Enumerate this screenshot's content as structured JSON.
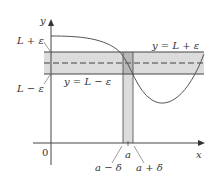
{
  "diagram": {
    "axes": {
      "x_label": "x",
      "y_label": "y",
      "origin_label": "0"
    },
    "y_labels": {
      "upper": "L + ε",
      "lower": "L − ε"
    },
    "line_labels": {
      "upper_line": "y = L + ε",
      "lower_line": "y = L − ε"
    },
    "x_labels": {
      "center": "a",
      "left": "a − δ",
      "right": "a + δ"
    },
    "colors": {
      "band_fill": "#dcdcdc",
      "overlap_fill": "#b8b8b8",
      "line": "#444444",
      "dashed": "#777777"
    }
  }
}
